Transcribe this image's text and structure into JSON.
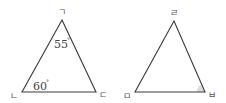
{
  "diagram": {
    "colors": {
      "stroke": "#3a3a3a",
      "label": "#555555",
      "shade": "#dcdcdc"
    },
    "triangle_left": {
      "vertices": {
        "top": {
          "label": "ㄱ"
        },
        "bottom_left": {
          "label": "ㄴ"
        },
        "bottom_right": {
          "label": "ㄷ"
        }
      },
      "angles": {
        "top": {
          "value": "55",
          "unit": "°"
        },
        "bottom_left": {
          "value": "60",
          "unit": "°"
        }
      }
    },
    "triangle_right": {
      "vertices": {
        "top": {
          "label": "ㄹ"
        },
        "bottom_left": {
          "label": "ㅁ"
        },
        "bottom_right": {
          "label": "ㅂ",
          "angle_marked": true
        }
      }
    }
  }
}
